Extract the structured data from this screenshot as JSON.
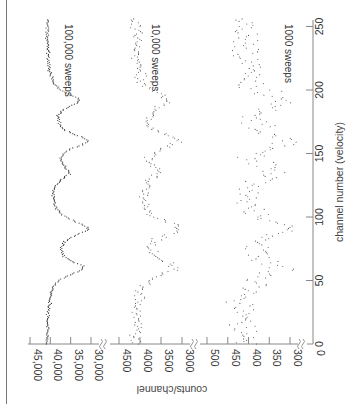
{
  "chart_data": {
    "type": "scatter",
    "orientation_note": "figure rendered rotated 90° clockwise; channel axis runs bottom-to-top on right edge",
    "title": "",
    "xlabel": "channel number (velocity)",
    "ylabel": "counts/channel",
    "x_ticks": [
      "0",
      "50",
      "100",
      "150",
      "200",
      "250"
    ],
    "x_range": [
      0,
      256
    ],
    "y_axis_segments": [
      {
        "range": [
          28000,
          45000
        ],
        "ticks": [
          "45,000",
          "40,000",
          "35,000",
          "30,000"
        ]
      },
      {
        "range": [
          2800,
          4600
        ],
        "ticks": [
          "4500",
          "4000",
          "3500",
          "3000"
        ]
      },
      {
        "range": [
          280,
          520
        ],
        "ticks": [
          "500",
          "450",
          "400",
          "350",
          "300"
        ]
      },
      {
        "range": [
          0,
          0
        ],
        "ticks": [
          "0"
        ]
      }
    ],
    "axis_breaks": true,
    "grid": false,
    "series": [
      {
        "name": "100,000 sweeps",
        "baseline": 41000,
        "dips": [
          {
            "channel": 60,
            "depth": 8500,
            "width": 7
          },
          {
            "channel": 91,
            "depth": 9500,
            "width": 8
          },
          {
            "channel": 135,
            "depth": 4500,
            "width": 7
          },
          {
            "channel": 160,
            "depth": 9200,
            "width": 7
          },
          {
            "channel": 192,
            "depth": 7500,
            "width": 7
          }
        ],
        "noise": 300
      },
      {
        "name": "10,000 sweeps",
        "baseline": 4100,
        "dips": [
          {
            "channel": 60,
            "depth": 850,
            "width": 7
          },
          {
            "channel": 91,
            "depth": 950,
            "width": 8
          },
          {
            "channel": 135,
            "depth": 450,
            "width": 7
          },
          {
            "channel": 160,
            "depth": 920,
            "width": 7
          },
          {
            "channel": 192,
            "depth": 750,
            "width": 7
          }
        ],
        "noise": 100
      },
      {
        "name": "1000 sweeps",
        "baseline": 410,
        "dips": [
          {
            "channel": 60,
            "depth": 85,
            "width": 7
          },
          {
            "channel": 91,
            "depth": 95,
            "width": 8
          },
          {
            "channel": 135,
            "depth": 45,
            "width": 7
          },
          {
            "channel": 160,
            "depth": 92,
            "width": 7
          },
          {
            "channel": 192,
            "depth": 75,
            "width": 7
          }
        ],
        "noise": 30
      }
    ]
  },
  "labels": {
    "series_100k": "100,000 sweeps",
    "series_10k": "10,000 sweeps",
    "series_1k": "1000 sweeps",
    "xlabel": "channel number (velocity)",
    "ylabel": "counts/channel",
    "x_ticks": [
      "0",
      "50",
      "100",
      "150",
      "200",
      "250"
    ],
    "y_ticks_top": [
      "45,000",
      "40,000",
      "35,000",
      "30,000"
    ],
    "y_ticks_mid": [
      "4500",
      "4000",
      "3500",
      "3000"
    ],
    "y_ticks_low": [
      "500",
      "450",
      "400",
      "350",
      "300"
    ],
    "y_tick_zero": "0"
  }
}
